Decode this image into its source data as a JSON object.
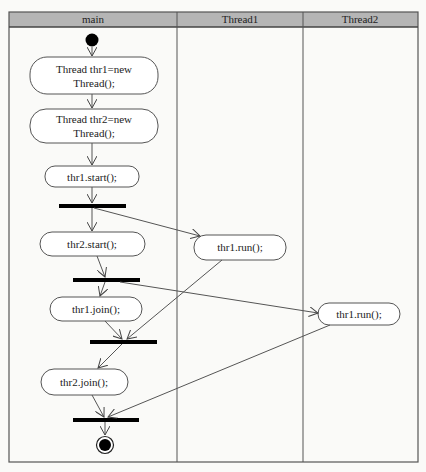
{
  "diagram": {
    "type": "UML activity diagram with swimlanes",
    "header_color": "#b5b5b5",
    "lanes": [
      {
        "label": "main"
      },
      {
        "label": "Thread1"
      },
      {
        "label": "Thread2"
      }
    ],
    "activities": {
      "create_thr1": {
        "line1": "Thread thr1=new",
        "line2": "Thread();"
      },
      "create_thr2": {
        "line1": "Thread thr2=new",
        "line2": "Thread();"
      },
      "thr1_start": {
        "label": "thr1.start();"
      },
      "thr2_start": {
        "label": "thr2.start();"
      },
      "thr1_join": {
        "label": "thr1.join();"
      },
      "thr2_join": {
        "label": "thr2.join();"
      },
      "thread1_run": {
        "label": "thr1.run();"
      },
      "thread2_run": {
        "label": "thr1.run();"
      }
    },
    "nodes": {
      "initial": "initial-node",
      "final": "final-node",
      "bars": [
        "fork-1",
        "fork-2",
        "join-1",
        "join-2"
      ]
    }
  }
}
